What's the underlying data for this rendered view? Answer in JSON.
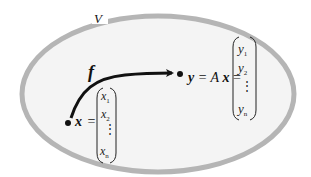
{
  "diagram": {
    "space_label": "V",
    "map_label": "f",
    "input": {
      "symbol": "x",
      "equals": "=",
      "components": [
        "x",
        "x",
        "⋮",
        "x"
      ],
      "subscripts": [
        "1",
        "2",
        "",
        "n"
      ]
    },
    "output": {
      "symbol": "y",
      "equation_middle": " = A",
      "equation_var": "x",
      "equals": " =",
      "components": [
        "y",
        "y",
        "⋮",
        "y"
      ],
      "subscripts": [
        "1",
        "2",
        "",
        "n"
      ]
    },
    "colors": {
      "ellipse_fill": "#f4f4f4",
      "ellipse_stroke": "#b5b5b5",
      "ink": "#111111",
      "background": "#ffffff"
    }
  }
}
